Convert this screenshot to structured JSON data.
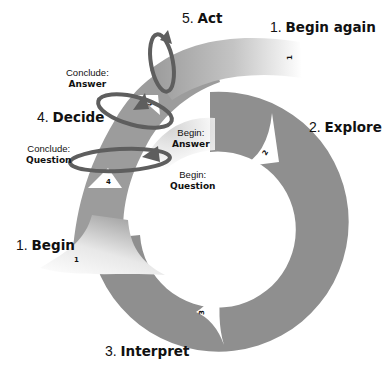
{
  "diagram": {
    "type": "spiral-cycle",
    "colors": {
      "band": "#8f8f8f",
      "band_light": "#b8b8b8",
      "band_fade": "#e9e9e9",
      "arrow": "#5e5e5e",
      "marker": "#ffffff",
      "text": "#111111"
    },
    "stages": [
      {
        "num": "1.",
        "name": "Begin",
        "marker": "1"
      },
      {
        "num": "2.",
        "name": "Explore",
        "marker": "2"
      },
      {
        "num": "3.",
        "name": "Interpret",
        "marker": "3"
      },
      {
        "num": "4.",
        "name": "Decide",
        "marker": "4"
      },
      {
        "num": "5.",
        "name": "Act",
        "marker": "5"
      },
      {
        "num": "1.",
        "name": "Begin again",
        "marker": "1"
      }
    ],
    "loops": {
      "conclude_answer": {
        "top": "Conclude:",
        "bottom": "Answer"
      },
      "conclude_question": {
        "top": "Conclude:",
        "bottom": "Question"
      },
      "begin_answer": {
        "top": "Begin:",
        "bottom": "Answer"
      },
      "begin_question": {
        "top": "Begin:",
        "bottom": "Question"
      }
    }
  }
}
